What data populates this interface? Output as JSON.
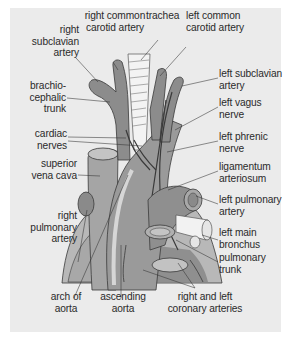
{
  "figure": {
    "colors": {
      "panel_bg": "#ebebeb",
      "vessel_dark": "#8a8a8a",
      "vessel_mid": "#a3a3a3",
      "heart_light": "#b8b8b8",
      "trachea": "#f2f2f2",
      "outline": "#3a3a3a",
      "leader_line": "#333333",
      "label_text": "#2a2a2a"
    }
  },
  "labels": {
    "right_subclavian_artery": "right\nsubclavian\nartery",
    "right_common_carotid_artery": "right common\ncarotid artery",
    "trachea": "trachea",
    "left_common_carotid_artery": "left common\ncarotid artery",
    "left_subclavian_artery": "left subclavian\nartery",
    "brachiocephalic_trunk": "brachio-\ncephalic\ntrunk",
    "left_vagus_nerve": "left vagus\nnerve",
    "cardiac_nerves": "cardiac\nnerves",
    "left_phrenic_nerve": "left phrenic\nnerve",
    "superior_vena_cava": "superior\nvena cava",
    "ligamentum_arteriosum": "ligamentum\narteriosum",
    "left_pulmonary_artery": "left pulmonary\nartery",
    "right_pulmonary_artery": "right\npulmonary\nartery",
    "left_main_bronchus": "left main\nbronchus",
    "pulmonary_trunk": "pulmonary\ntrunk",
    "arch_of_aorta": "arch of\naorta",
    "ascending_aorta": "ascending\naorta",
    "right_and_left_coronary_arteries": "right and left\ncoronary arteries"
  }
}
